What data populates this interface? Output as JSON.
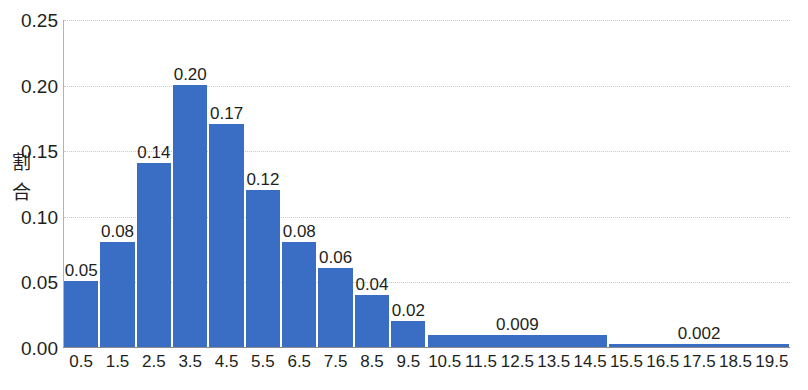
{
  "figure": {
    "background_color": "#ffffff",
    "bar_color": "#3a6ec4",
    "gridline_color": "#c9c9c9",
    "axis_color": "#8c8c8c",
    "text_color": "#231f20"
  },
  "axes": {
    "y_title_line1": "割",
    "y_title_line2": "合",
    "y_title": "割合",
    "y_tick_labels": [
      "0.25",
      "0.20",
      "0.15",
      "0.10",
      "0.05",
      "0.00"
    ],
    "y_tick_values": [
      0.25,
      0.2,
      0.15,
      0.1,
      0.05,
      0
    ],
    "x_tick_labels": [
      "0.5",
      "1.5",
      "2.5",
      "3.5",
      "4.5",
      "5.5",
      "6.5",
      "7.5",
      "8.5",
      "9.5",
      "10.5",
      "11.5",
      "12.5",
      "13.5",
      "14.5",
      "15.5",
      "16.5",
      "17.5",
      "18.5",
      "19.5"
    ]
  },
  "bottom_caption": {
    "text": ""
  },
  "chart_data": {
    "type": "bar",
    "title": "",
    "xlabel": "",
    "ylabel": "割合",
    "ylim": [
      0,
      0.25
    ],
    "ytick_step": 0.05,
    "grid": true,
    "legend": false,
    "categories": [
      "0.5",
      "1.5",
      "2.5",
      "3.5",
      "4.5",
      "5.5",
      "6.5",
      "7.5",
      "8.5",
      "9.5",
      "10.5",
      "11.5",
      "12.5",
      "13.5",
      "14.5",
      "15.5",
      "16.5",
      "17.5",
      "18.5",
      "19.5"
    ],
    "values": [
      0.05,
      0.08,
      0.14,
      0.2,
      0.17,
      0.12,
      0.08,
      0.06,
      0.04,
      0.02,
      0.009,
      0.009,
      0.009,
      0.009,
      0.009,
      0.002,
      0.002,
      0.002,
      0.002,
      0.002
    ],
    "bars": [
      {
        "category": "0.5",
        "value": 0.05,
        "label": "0.05",
        "span": 1
      },
      {
        "category": "1.5",
        "value": 0.08,
        "label": "0.08",
        "span": 1
      },
      {
        "category": "2.5",
        "value": 0.14,
        "label": "0.14",
        "span": 1
      },
      {
        "category": "3.5",
        "value": 0.2,
        "label": "0.20",
        "span": 1
      },
      {
        "category": "4.5",
        "value": 0.17,
        "label": "0.17",
        "span": 1
      },
      {
        "category": "5.5",
        "value": 0.12,
        "label": "0.12",
        "span": 1
      },
      {
        "category": "6.5",
        "value": 0.08,
        "label": "0.08",
        "span": 1
      },
      {
        "category": "7.5",
        "value": 0.06,
        "label": "0.06",
        "span": 1
      },
      {
        "category": "8.5",
        "value": 0.04,
        "label": "0.04",
        "span": 1
      },
      {
        "category": "9.5",
        "value": 0.02,
        "label": "0.02",
        "span": 1
      },
      {
        "category": "10.5-14.5",
        "value": 0.009,
        "label": "0.009",
        "span": 5
      },
      {
        "category": "15.5-19.5",
        "value": 0.002,
        "label": "0.002",
        "span": 5
      }
    ]
  }
}
